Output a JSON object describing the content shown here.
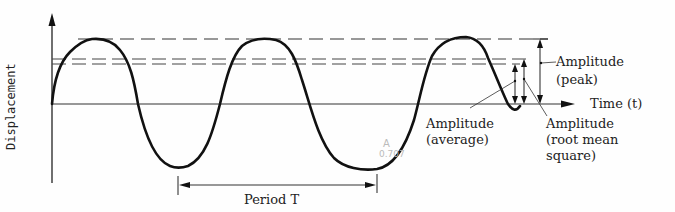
{
  "diagram": {
    "type": "sine-wave-amplitude-diagram",
    "axes": {
      "y_label": "Displacement",
      "x_label": "Time (t)"
    },
    "annotations": {
      "amplitude_peak": [
        "Amplitude",
        "(peak)"
      ],
      "amplitude_average": [
        "Amplitude",
        "(average)"
      ],
      "amplitude_rms": [
        "Amplitude",
        "(root mean",
        "square)"
      ],
      "period": "Period T"
    },
    "colors": {
      "line": "#111111",
      "dash": "#333333",
      "text": "#222222"
    }
  }
}
